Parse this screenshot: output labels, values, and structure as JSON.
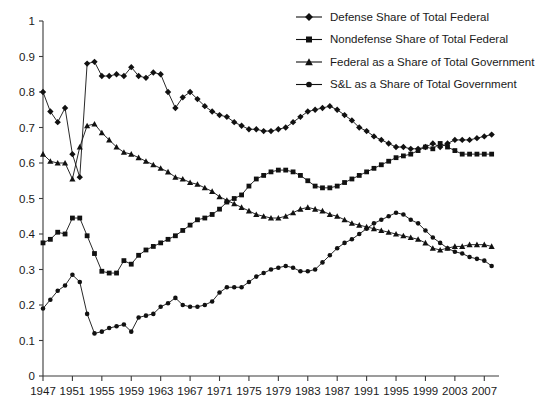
{
  "chart_data": {
    "type": "line",
    "title": "",
    "xlabel": "",
    "ylabel": "",
    "xlim": [
      1947,
      2009
    ],
    "ylim": [
      0,
      1
    ],
    "grid": false,
    "legend_position": "top-right",
    "y_ticks": [
      "0",
      "0.1",
      "0.2",
      "0.3",
      "0.4",
      "0.5",
      "0.6",
      "0.7",
      "0.8",
      "0.9",
      "1"
    ],
    "x_ticks": [
      "1947",
      "1951",
      "1955",
      "1959",
      "1963",
      "1967",
      "1971",
      "1975",
      "1979",
      "1983",
      "1987",
      "1991",
      "1995",
      "1999",
      "2003",
      "2007"
    ],
    "x": [
      1947,
      1948,
      1949,
      1950,
      1951,
      1952,
      1953,
      1954,
      1955,
      1956,
      1957,
      1958,
      1959,
      1960,
      1961,
      1962,
      1963,
      1964,
      1965,
      1966,
      1967,
      1968,
      1969,
      1970,
      1971,
      1972,
      1973,
      1974,
      1975,
      1976,
      1977,
      1978,
      1979,
      1980,
      1981,
      1982,
      1983,
      1984,
      1985,
      1986,
      1987,
      1988,
      1989,
      1990,
      1991,
      1992,
      1993,
      1994,
      1995,
      1996,
      1997,
      1998,
      1999,
      2000,
      2001,
      2002,
      2003,
      2004,
      2005,
      2006,
      2007,
      2008
    ],
    "series": [
      {
        "name": "Defense Share of Total Federal",
        "marker": "diamond",
        "color": "#111111",
        "values": [
          0.8,
          0.745,
          0.715,
          0.755,
          0.625,
          0.56,
          0.88,
          0.885,
          0.845,
          0.845,
          0.85,
          0.845,
          0.87,
          0.845,
          0.84,
          0.855,
          0.85,
          0.8,
          0.755,
          0.785,
          0.8,
          0.78,
          0.76,
          0.745,
          0.735,
          0.73,
          0.715,
          0.705,
          0.695,
          0.695,
          0.69,
          0.69,
          0.695,
          0.7,
          0.715,
          0.73,
          0.745,
          0.75,
          0.755,
          0.76,
          0.75,
          0.735,
          0.72,
          0.7,
          0.69,
          0.675,
          0.665,
          0.655,
          0.645,
          0.645,
          0.64,
          0.64,
          0.645,
          0.655,
          0.645,
          0.655,
          0.665,
          0.665,
          0.665,
          0.67,
          0.675,
          0.68
        ]
      },
      {
        "name": "Nondefense Share of Total Federal",
        "marker": "square",
        "color": "#111111",
        "values": [
          0.375,
          0.385,
          0.405,
          0.4,
          0.445,
          0.445,
          0.395,
          0.345,
          0.295,
          0.29,
          0.29,
          0.325,
          0.315,
          0.34,
          0.355,
          0.365,
          0.375,
          0.385,
          0.395,
          0.41,
          0.425,
          0.44,
          0.445,
          0.455,
          0.47,
          0.49,
          0.5,
          0.51,
          0.535,
          0.555,
          0.565,
          0.575,
          0.58,
          0.58,
          0.575,
          0.565,
          0.55,
          0.535,
          0.53,
          0.53,
          0.535,
          0.545,
          0.555,
          0.565,
          0.575,
          0.585,
          0.595,
          0.605,
          0.615,
          0.62,
          0.625,
          0.635,
          0.645,
          0.64,
          0.655,
          0.645,
          0.635,
          0.625,
          0.625,
          0.625,
          0.625,
          0.625
        ]
      },
      {
        "name": "Federal as a Share of Total Government",
        "marker": "triangle",
        "color": "#111111",
        "values": [
          0.625,
          0.605,
          0.6,
          0.6,
          0.555,
          0.645,
          0.705,
          0.71,
          0.685,
          0.665,
          0.645,
          0.63,
          0.625,
          0.615,
          0.605,
          0.595,
          0.585,
          0.575,
          0.56,
          0.555,
          0.545,
          0.54,
          0.53,
          0.52,
          0.505,
          0.495,
          0.485,
          0.475,
          0.465,
          0.455,
          0.45,
          0.445,
          0.445,
          0.45,
          0.46,
          0.47,
          0.475,
          0.47,
          0.465,
          0.455,
          0.45,
          0.44,
          0.43,
          0.425,
          0.42,
          0.415,
          0.41,
          0.405,
          0.4,
          0.395,
          0.39,
          0.385,
          0.375,
          0.36,
          0.355,
          0.36,
          0.365,
          0.365,
          0.37,
          0.37,
          0.37,
          0.365
        ]
      },
      {
        "name": "S&L as a Share of Total Government",
        "marker": "circle",
        "color": "#111111",
        "values": [
          0.19,
          0.215,
          0.24,
          0.255,
          0.285,
          0.265,
          0.175,
          0.12,
          0.125,
          0.135,
          0.14,
          0.145,
          0.125,
          0.165,
          0.17,
          0.175,
          0.195,
          0.205,
          0.22,
          0.2,
          0.195,
          0.195,
          0.2,
          0.21,
          0.235,
          0.25,
          0.25,
          0.25,
          0.265,
          0.28,
          0.29,
          0.3,
          0.305,
          0.31,
          0.305,
          0.295,
          0.295,
          0.3,
          0.32,
          0.34,
          0.36,
          0.375,
          0.385,
          0.4,
          0.415,
          0.43,
          0.44,
          0.45,
          0.46,
          0.455,
          0.44,
          0.43,
          0.41,
          0.39,
          0.375,
          0.36,
          0.35,
          0.345,
          0.335,
          0.33,
          0.325,
          0.31
        ]
      }
    ]
  },
  "legend": {
    "items": [
      {
        "label": "Defense Share of Total Federal",
        "marker": "diamond"
      },
      {
        "label": "Nondefense Share of Total Federal",
        "marker": "square"
      },
      {
        "label": "Federal as a Share of Total Government",
        "marker": "triangle"
      },
      {
        "label": "S&L as a Share of Total Government",
        "marker": "circle"
      }
    ]
  }
}
